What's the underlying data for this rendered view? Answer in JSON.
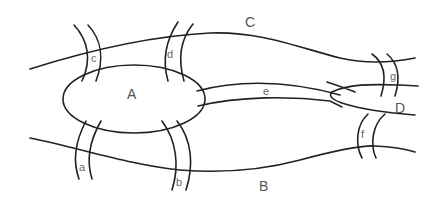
{
  "diagram": {
    "land_masses": [
      {
        "id": "A",
        "label": "A",
        "description": "central island"
      },
      {
        "id": "B",
        "label": "B",
        "description": "south bank"
      },
      {
        "id": "C",
        "label": "C",
        "description": "north bank"
      },
      {
        "id": "D",
        "label": "D",
        "description": "eastern land"
      }
    ],
    "bridges": [
      {
        "id": "a",
        "label": "a",
        "connects": [
          "A",
          "B"
        ]
      },
      {
        "id": "b",
        "label": "b",
        "connects": [
          "A",
          "B"
        ]
      },
      {
        "id": "c",
        "label": "c",
        "connects": [
          "A",
          "C"
        ]
      },
      {
        "id": "d",
        "label": "d",
        "connects": [
          "A",
          "C"
        ]
      },
      {
        "id": "e",
        "label": "e",
        "connects": [
          "A",
          "D"
        ]
      },
      {
        "id": "f",
        "label": "f",
        "connects": [
          "B",
          "D"
        ]
      },
      {
        "id": "g",
        "label": "g",
        "connects": [
          "C",
          "D"
        ]
      }
    ],
    "colors": {
      "stroke": "#222222",
      "label": "#555555",
      "background": "#ffffff"
    }
  }
}
